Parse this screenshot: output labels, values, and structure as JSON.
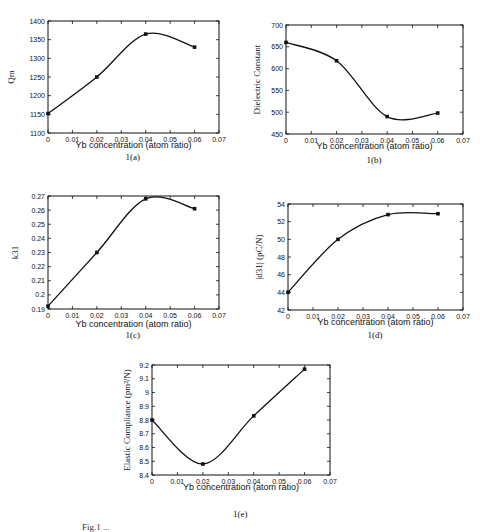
{
  "figure": {
    "caption": "Fig.1 ..."
  },
  "chart_data": [
    {
      "id": "a",
      "type": "line",
      "panel_label": "1(a)",
      "title": "",
      "xlabel": "Yb concentration (atom ratio)",
      "ylabel": "Qm",
      "x": [
        0,
        0.02,
        0.04,
        0.06
      ],
      "series": [
        {
          "name": "Qm",
          "values": [
            1152,
            1250,
            1365,
            1330
          ]
        }
      ],
      "xlim": [
        0,
        0.07
      ],
      "ylim": [
        1100,
        1400
      ],
      "xticks": [
        "0",
        "0.01",
        "0.02",
        "0.03",
        "0.04",
        "0.05",
        "0.06",
        "0.07"
      ],
      "yticks": [
        "1100",
        "1150",
        "1200",
        "1250",
        "1300",
        "1350",
        "1400"
      ],
      "grid": false,
      "legend": null
    },
    {
      "id": "b",
      "type": "line",
      "panel_label": "1(b)",
      "title": "",
      "xlabel": "Yb concentration (atom ratio)",
      "ylabel": "Dielectric Constant",
      "x": [
        0,
        0.02,
        0.04,
        0.06
      ],
      "series": [
        {
          "name": "Dielectric Constant",
          "values": [
            660,
            618,
            490,
            498
          ]
        }
      ],
      "xlim": [
        0,
        0.07
      ],
      "ylim": [
        450,
        700
      ],
      "xticks": [
        "0",
        "0.01",
        "0.02",
        "0.03",
        "0.04",
        "0.05",
        "0.06",
        "0.07"
      ],
      "yticks": [
        "450",
        "500",
        "550",
        "600",
        "650",
        "700"
      ],
      "grid": false,
      "legend": null
    },
    {
      "id": "c",
      "type": "line",
      "panel_label": "1(c)",
      "title": "",
      "xlabel": "Yb concentration (atom ratio)",
      "ylabel": "k31",
      "x": [
        0,
        0.02,
        0.04,
        0.06
      ],
      "series": [
        {
          "name": "k31",
          "values": [
            0.192,
            0.23,
            0.268,
            0.261
          ]
        }
      ],
      "xlim": [
        0,
        0.07
      ],
      "ylim": [
        0.19,
        0.27
      ],
      "xticks": [
        "0",
        "0.01",
        "0.02",
        "0.03",
        "0.04",
        "0.05",
        "0.06",
        "0.07"
      ],
      "yticks": [
        "0.19",
        "0.2",
        "0.21",
        "0.22",
        "0.23",
        "0.24",
        "0.25",
        "0.26",
        "0.27"
      ],
      "grid": false,
      "legend": null
    },
    {
      "id": "d",
      "type": "line",
      "panel_label": "1(d)",
      "title": "",
      "xlabel": "Yb concentration (atom ratio)",
      "ylabel": "|d31| (pC/N)",
      "x": [
        0,
        0.02,
        0.04,
        0.06
      ],
      "series": [
        {
          "name": "|d31|",
          "values": [
            44.0,
            50.0,
            52.8,
            52.9
          ]
        }
      ],
      "xlim": [
        0,
        0.07
      ],
      "ylim": [
        42,
        54
      ],
      "xticks": [
        "0",
        "0.01",
        "0.02",
        "0.03",
        "0.04",
        "0.05",
        "0.06",
        "0.07"
      ],
      "yticks": [
        "42",
        "44",
        "46",
        "48",
        "50",
        "52",
        "54"
      ],
      "grid": false,
      "legend": null
    },
    {
      "id": "e",
      "type": "line",
      "panel_label": "1(e)",
      "title": "",
      "xlabel": "Yb concentration (atom ratio)",
      "ylabel": "Elastic Compliance (pm²/N)",
      "x": [
        0,
        0.02,
        0.04,
        0.06
      ],
      "series": [
        {
          "name": "Elastic Compliance",
          "values": [
            8.8,
            8.48,
            8.83,
            9.17
          ]
        }
      ],
      "xlim": [
        0,
        0.07
      ],
      "ylim": [
        8.4,
        9.2
      ],
      "xticks": [
        "0",
        "0.01",
        "0.02",
        "0.03",
        "0.04",
        "0.05",
        "0.06",
        "0.07"
      ],
      "yticks": [
        "8.4",
        "8.5",
        "8.6",
        "8.7",
        "8.8",
        "8.9",
        "9",
        "9.1",
        "9.2"
      ],
      "grid": false,
      "legend": null
    }
  ],
  "layout": {
    "a": {
      "left": 48,
      "top": 21,
      "width": 171,
      "height": 112,
      "xlabel_y": 148,
      "panel_y": 160,
      "ylabel_x": 14
    },
    "b": {
      "left": 286,
      "top": 25,
      "width": 177,
      "height": 109,
      "xlabel_y": 149,
      "panel_y": 163,
      "ylabel_x": 260
    },
    "c": {
      "left": 48,
      "top": 196,
      "width": 171,
      "height": 113,
      "xlabel_y": 327,
      "panel_y": 338,
      "ylabel_x": 18
    },
    "d": {
      "left": 288,
      "top": 204,
      "width": 175,
      "height": 106,
      "xlabel_y": 325,
      "panel_y": 338,
      "ylabel_x": 262
    },
    "e": {
      "left": 152,
      "top": 365,
      "width": 178,
      "height": 110,
      "xlabel_y": 490,
      "panel_y": 517,
      "ylabel_x": 130
    }
  }
}
